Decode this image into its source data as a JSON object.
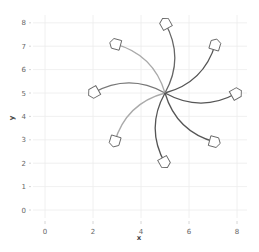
{
  "chart_data": {
    "type": "line",
    "subtype": "curved-arrows-from-center",
    "title": "",
    "xlabel": "x",
    "ylabel": "y",
    "xlim": [
      -0.5,
      8.3
    ],
    "ylim": [
      -0.4,
      8.3
    ],
    "grid": true,
    "legend": "none",
    "x_ticks": [
      "0",
      "2",
      "4",
      "6",
      "8"
    ],
    "y_ticks": [
      "0",
      "1",
      "2",
      "3",
      "4",
      "5",
      "6",
      "7",
      "8"
    ],
    "origin": {
      "x": 5,
      "y": 5
    },
    "series": [
      {
        "name": "arrow-0deg",
        "from": [
          5,
          5
        ],
        "to": [
          8.0,
          5.0
        ],
        "color": "#555555"
      },
      {
        "name": "arrow-45deg",
        "from": [
          5,
          5
        ],
        "to": [
          7.1,
          7.1
        ],
        "color": "#555555"
      },
      {
        "name": "arrow-90deg",
        "from": [
          5,
          5
        ],
        "to": [
          5.0,
          8.0
        ],
        "color": "#666666"
      },
      {
        "name": "arrow-135deg",
        "from": [
          5,
          5
        ],
        "to": [
          2.9,
          7.1
        ],
        "color": "#aaaaaa"
      },
      {
        "name": "arrow-180deg",
        "from": [
          5,
          5
        ],
        "to": [
          2.0,
          5.0
        ],
        "color": "#777777"
      },
      {
        "name": "arrow-225deg",
        "from": [
          5,
          5
        ],
        "to": [
          2.9,
          2.9
        ],
        "color": "#aaaaaa"
      },
      {
        "name": "arrow-270deg",
        "from": [
          5,
          5
        ],
        "to": [
          5.0,
          2.0
        ],
        "color": "#555555"
      },
      {
        "name": "arrow-315deg",
        "from": [
          5,
          5
        ],
        "to": [
          7.1,
          2.9
        ],
        "color": "#555555"
      }
    ]
  }
}
